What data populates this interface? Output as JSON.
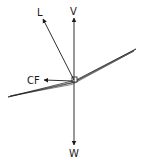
{
  "diagram": {
    "labels": {
      "lift": "L",
      "vertical": "V",
      "centrifugal": "CF",
      "weight": "W"
    },
    "colors": {
      "stroke": "#1a1a1a",
      "background": "#ffffff"
    }
  }
}
